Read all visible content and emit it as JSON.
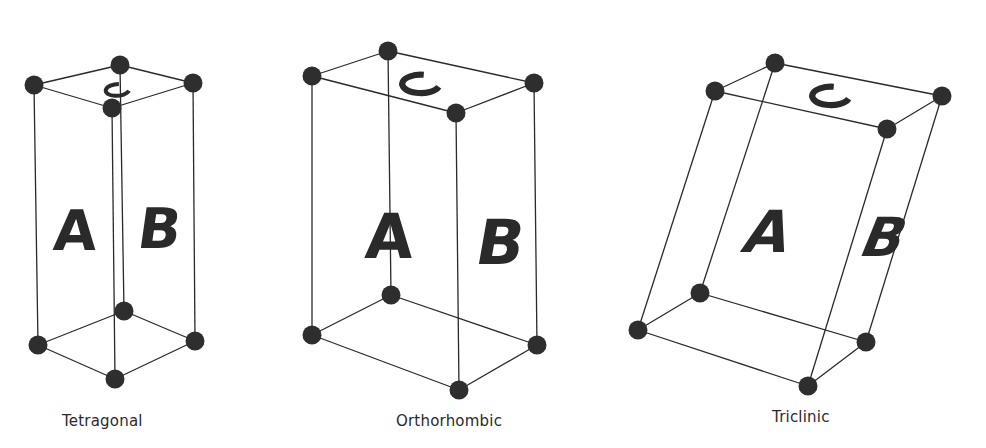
{
  "figure": {
    "colors": {
      "line": "#2a2a2a",
      "atom": "#2e2e2e",
      "background": "#ffffff"
    },
    "cells": [
      {
        "name": "Tetragonal",
        "caption": "Tetragonal",
        "caption_pos": [
          62,
          412
        ],
        "vertices": {
          "tb": [
            120,
            65
          ],
          "tl": [
            34,
            85
          ],
          "tr": [
            193,
            83
          ],
          "tf": [
            112,
            108
          ],
          "bb": [
            124,
            311
          ],
          "bl": [
            38,
            345
          ],
          "br": [
            195,
            341
          ],
          "bf": [
            115,
            379
          ]
        },
        "face_labels": {
          "A": "A",
          "B": "B",
          "C": "C"
        },
        "label_pos": {
          "A": [
            74,
            250
          ],
          "B": [
            157,
            248
          ],
          "C": [
            117,
            90
          ]
        },
        "label_size": {
          "A": 56,
          "B": 56
        },
        "label_skew": {
          "A": -4,
          "B": -8
        },
        "c_size": 14
      },
      {
        "name": "Orthorhombic",
        "caption": "Orthorhombic",
        "caption_pos": [
          396,
          412
        ],
        "vertices": {
          "tb": [
            388,
            51
          ],
          "tl": [
            312,
            76
          ],
          "tr": [
            534,
            83
          ],
          "tf": [
            456,
            113
          ],
          "bb": [
            391,
            295
          ],
          "bl": [
            312,
            335
          ],
          "br": [
            537,
            345
          ],
          "bf": [
            459,
            390
          ]
        },
        "face_labels": {
          "A": "A",
          "B": "B",
          "C": "C"
        },
        "label_pos": {
          "A": [
            388,
            258
          ],
          "B": [
            497,
            264
          ],
          "C": [
            420,
            84
          ]
        },
        "label_size": {
          "A": 62,
          "B": 62
        },
        "label_skew": {
          "A": -4,
          "B": -10
        },
        "c_size": 22
      },
      {
        "name": "Triclinic",
        "caption": "Triclinic",
        "caption_pos": [
          772,
          408
        ],
        "vertices": {
          "tb": [
            775,
            63
          ],
          "tl": [
            715,
            91
          ],
          "tr": [
            942,
            96
          ],
          "tf": [
            887,
            129
          ],
          "bb": [
            700,
            293
          ],
          "bl": [
            638,
            330
          ],
          "br": [
            866,
            342
          ],
          "bf": [
            808,
            386
          ]
        },
        "face_labels": {
          "A": "A",
          "B": "B",
          "C": "C"
        },
        "label_pos": {
          "A": [
            762,
            252
          ],
          "B": [
            877,
            256
          ],
          "C": [
            830,
            96
          ]
        },
        "label_size": {
          "A": 58,
          "B": 54
        },
        "label_skew": {
          "A": -18,
          "B": -22
        },
        "c_size": 22
      }
    ]
  }
}
